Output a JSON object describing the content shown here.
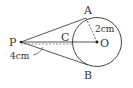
{
  "diagram": {
    "type": "geometry",
    "points": {
      "P": {
        "label": "P"
      },
      "A": {
        "label": "A"
      },
      "B": {
        "label": "B"
      },
      "C": {
        "label": "C"
      },
      "O": {
        "label": "O"
      }
    },
    "measurements": {
      "radius": "2cm",
      "pc_length": "4cm"
    },
    "colors": {
      "stroke": "#444444",
      "background": "#ffffff"
    }
  }
}
